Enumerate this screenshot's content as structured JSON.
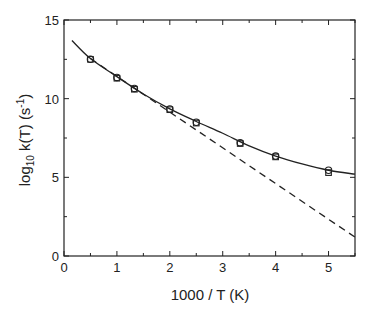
{
  "chart_data": {
    "type": "scatter",
    "title": "",
    "xlabel": "1000 / T (K)",
    "ylabel": "log10 k(T) (s^-1)",
    "ylabel_parts": {
      "pre": "log",
      "sub": "10",
      "mid": " k(T)  (s",
      "sup": "-1",
      "post": ")"
    },
    "xlim": [
      0,
      5.5
    ],
    "ylim": [
      0,
      15
    ],
    "x_ticks": [
      0,
      1,
      2,
      3,
      4,
      5
    ],
    "y_ticks": [
      0,
      5,
      10,
      15
    ],
    "grid": false,
    "series": [
      {
        "name": "circles",
        "marker": "circle",
        "x": [
          0.5,
          1.0,
          1.33,
          2.0,
          2.5,
          3.33,
          4.0,
          5.0
        ],
        "y": [
          12.5,
          11.35,
          10.65,
          9.35,
          8.5,
          7.2,
          6.35,
          5.45
        ]
      },
      {
        "name": "squares",
        "marker": "square",
        "x": [
          0.5,
          1.0,
          1.33,
          2.0,
          2.5,
          3.33,
          4.0,
          5.0
        ],
        "y": [
          12.5,
          11.3,
          10.6,
          9.3,
          8.45,
          7.15,
          6.3,
          5.3
        ]
      },
      {
        "name": "fit-solid",
        "style": "solid",
        "x": [
          0.15,
          0.5,
          1.0,
          1.5,
          2.0,
          2.5,
          3.0,
          3.5,
          4.0,
          4.5,
          5.0,
          5.5
        ],
        "y": [
          13.7,
          12.55,
          11.4,
          10.3,
          9.35,
          8.55,
          7.8,
          7.0,
          6.35,
          5.85,
          5.45,
          5.2
        ]
      },
      {
        "name": "arrhenius-dashed",
        "style": "dashed",
        "x": [
          0.5,
          5.5
        ],
        "y": [
          12.55,
          1.2
        ]
      }
    ]
  }
}
